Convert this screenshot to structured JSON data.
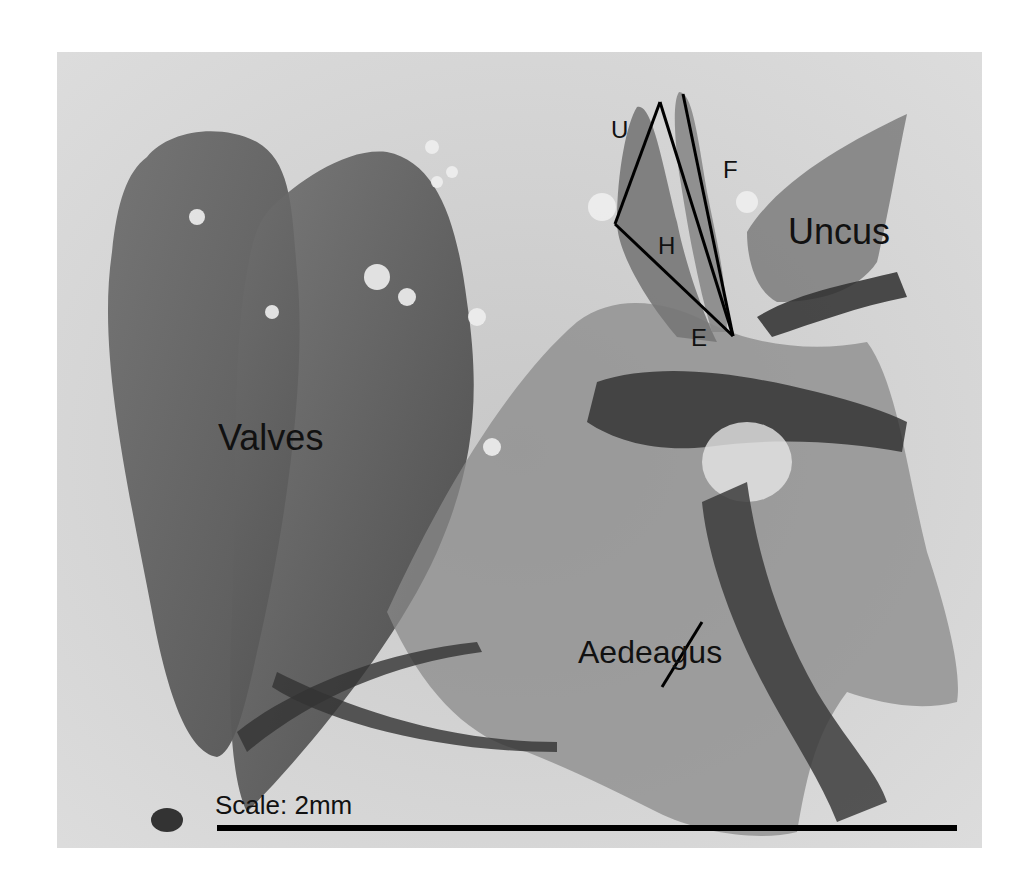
{
  "figure": {
    "type": "grayscale micrograph",
    "background": "#ffffff",
    "labels": {
      "valves": "Valves",
      "uncus": "Uncus",
      "aedeagus": "Aedeagus",
      "u": "U",
      "f": "F",
      "h": "H",
      "e": "E"
    },
    "scale": {
      "text": "Scale: 2mm"
    }
  }
}
